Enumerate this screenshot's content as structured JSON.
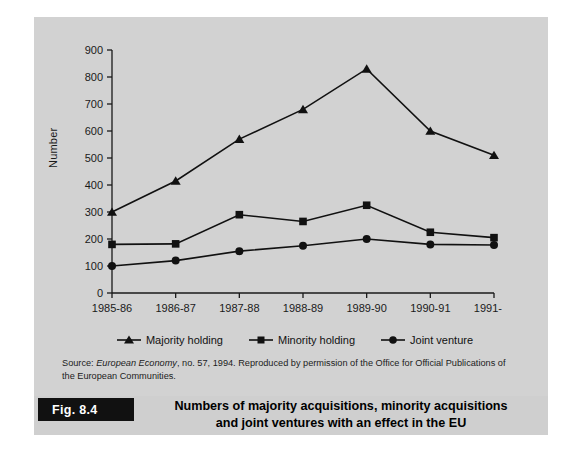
{
  "figure": {
    "tag": "Fig. 8.4",
    "title_line1": "Numbers of majority acquisitions, minority acquisitions",
    "title_line2": "and joint ventures with an effect in the EU"
  },
  "source": {
    "prefix": "Source: ",
    "italic": "European Economy",
    "rest": ", no. 57, 1994. Reproduced by permission of the Office for Official Publications of the European Communities."
  },
  "legend": {
    "items": [
      {
        "label": "Majority holding",
        "marker": "triangle-marker-icon",
        "color": "#111111"
      },
      {
        "label": "Minority holding",
        "marker": "square-marker-icon",
        "color": "#111111"
      },
      {
        "label": "Joint venture",
        "marker": "circle-marker-icon",
        "color": "#111111"
      }
    ]
  },
  "chart_data": {
    "type": "line",
    "title": "Numbers of majority acquisitions, minority acquisitions and joint ventures with an effect in the EU",
    "xlabel": "",
    "ylabel": "Number",
    "categories": [
      "1985-86",
      "1986-87",
      "1987-88",
      "1988-89",
      "1989-90",
      "1990-91",
      "1991-92"
    ],
    "ylim": [
      0,
      900
    ],
    "yticks": [
      0,
      100,
      200,
      300,
      400,
      500,
      600,
      700,
      800,
      900
    ],
    "ytick_labels": [
      "0",
      "100",
      "200",
      "300",
      "400",
      "500",
      "600",
      "700",
      "800",
      "900"
    ],
    "grid": false,
    "legend_position": "bottom",
    "series": [
      {
        "name": "Majority holding",
        "marker": "triangle",
        "color": "#111111",
        "values": [
          300,
          415,
          570,
          680,
          830,
          600,
          510
        ]
      },
      {
        "name": "Minority holding",
        "marker": "square",
        "color": "#111111",
        "values": [
          180,
          182,
          290,
          265,
          325,
          225,
          205
        ]
      },
      {
        "name": "Joint venture",
        "marker": "circle",
        "color": "#111111",
        "values": [
          100,
          120,
          155,
          175,
          200,
          180,
          178
        ]
      }
    ]
  },
  "colors": {
    "panel_background": "#d2d2d2",
    "caption_background": "#cfcfcf",
    "tag_background": "#111111",
    "ink": "#111111"
  }
}
